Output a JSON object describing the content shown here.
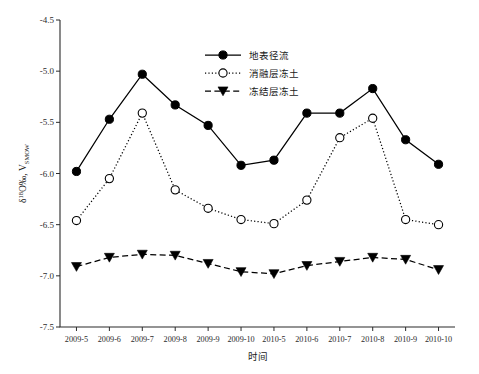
{
  "chart_data": {
    "type": "line",
    "title": "",
    "xlabel": "时间",
    "ylabel": "δ18O‰, VSMOW",
    "ylabel_parts": {
      "delta": "δ",
      "superscript": "18",
      "main": "O‰, V",
      "subscript": "SMOW"
    },
    "categories": [
      "2009-5",
      "2009-6",
      "2009-7",
      "2009-8",
      "2009-9",
      "2009-10",
      "2010-5",
      "2010-6",
      "2010-7",
      "2010-8",
      "2010-9",
      "2010-10"
    ],
    "ylim": [
      -7.5,
      -4.5
    ],
    "yticks": [
      -4.5,
      -5.0,
      -5.5,
      -6.0,
      -6.5,
      -7.0,
      -7.5
    ],
    "ytick_labels": [
      "-4.5",
      "-5.0",
      "-5.5",
      "-6.0",
      "-6.5",
      "-7.0",
      "-7.5"
    ],
    "grid": false,
    "legend_position": "top-center",
    "series": [
      {
        "name": "地表径流",
        "marker": "filled-circle",
        "line": "solid",
        "color": "#000000",
        "values": [
          -5.98,
          -5.47,
          -5.03,
          -5.33,
          -5.53,
          -5.92,
          -5.87,
          -5.41,
          -5.41,
          -5.17,
          -5.67,
          -5.91
        ]
      },
      {
        "name": "消融层冻土",
        "marker": "open-circle",
        "line": "dotted",
        "color": "#000000",
        "values": [
          -6.46,
          -6.05,
          -5.41,
          -6.16,
          -6.34,
          -6.45,
          -6.49,
          -6.26,
          -5.65,
          -5.46,
          -6.45,
          -6.5
        ]
      },
      {
        "name": "冻结层冻土",
        "marker": "filled-triangle-down",
        "line": "dashed",
        "color": "#000000",
        "values": [
          -6.91,
          -6.82,
          -6.79,
          -6.8,
          -6.88,
          -6.96,
          -6.98,
          -6.9,
          -6.86,
          -6.82,
          -6.84,
          -6.94
        ]
      }
    ]
  }
}
